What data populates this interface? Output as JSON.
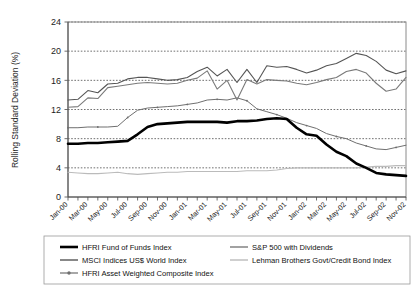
{
  "chart_data": {
    "type": "line",
    "title": "",
    "xlabel": "",
    "ylabel": "Rolling Standard Deviation (%)",
    "ylim": [
      0,
      24
    ],
    "yticks": [
      0,
      4,
      8,
      12,
      16,
      20,
      24
    ],
    "grid": true,
    "legend_position": "bottom",
    "x": [
      "Jan-00",
      "Feb-00",
      "Mar-00",
      "Apr-00",
      "May-00",
      "Jun-00",
      "Jul-00",
      "Aug-00",
      "Sep-00",
      "Oct-00",
      "Nov-00",
      "Dec-00",
      "Jan-01",
      "Feb-01",
      "Mar-01",
      "Apr-01",
      "May-01",
      "Jun-01",
      "Jul-01",
      "Aug-01",
      "Sep-01",
      "Oct-01",
      "Nov-01",
      "Dec-01",
      "Jan-02",
      "Feb-02",
      "Mar-02",
      "Apr-02",
      "May-02",
      "Jun-02",
      "Jul-02",
      "Aug-02",
      "Sep-02",
      "Oct-02",
      "Nov-02"
    ],
    "xtick_labels": [
      "Jan-00",
      "Mar-00",
      "May-00",
      "Jul-00",
      "Sep-00",
      "Nov-00",
      "Jan-01",
      "Mar-01",
      "May-01",
      "Jul-01",
      "Sep-01",
      "Nov-01",
      "Jan-02",
      "Mar-02",
      "May-02",
      "Jul-02",
      "Sep-02",
      "Nov-02"
    ],
    "series": [
      {
        "name": "HFRI Fund of Funds Index",
        "color": "#000000",
        "width": 2.6,
        "marker": "none",
        "values": [
          7.3,
          7.3,
          7.4,
          7.4,
          7.5,
          7.6,
          7.7,
          8.6,
          9.6,
          10.0,
          10.1,
          10.2,
          10.3,
          10.3,
          10.3,
          10.3,
          10.2,
          10.4,
          10.4,
          10.5,
          10.7,
          10.8,
          10.7,
          9.5,
          8.6,
          8.4,
          7.2,
          6.2,
          5.6,
          4.6,
          4.0,
          3.3,
          3.1,
          3.0,
          2.9
        ]
      },
      {
        "name": "MSCI Indices US$ World Index",
        "color": "#555555",
        "width": 1.1,
        "marker": "none",
        "values": [
          13.3,
          13.4,
          14.6,
          14.3,
          15.5,
          15.6,
          16.2,
          16.4,
          16.4,
          16.2,
          16.0,
          16.1,
          16.4,
          17.2,
          17.8,
          16.6,
          17.5,
          15.7,
          17.5,
          15.7,
          18.0,
          17.8,
          17.9,
          17.5,
          17.0,
          17.4,
          18.0,
          18.3,
          19.0,
          19.7,
          19.4,
          18.6,
          17.4,
          16.9,
          17.3
        ]
      },
      {
        "name": "HFRI Asset Weighted Composite Index",
        "color": "#6f6f6f",
        "width": 1.0,
        "marker": "dot",
        "values": [
          9.5,
          9.5,
          9.6,
          9.6,
          9.6,
          9.7,
          10.9,
          11.9,
          12.2,
          12.3,
          12.4,
          12.5,
          12.7,
          12.9,
          13.3,
          13.4,
          13.3,
          13.6,
          13.2,
          12.1,
          11.7,
          11.3,
          10.8,
          10.2,
          9.8,
          9.4,
          8.7,
          8.3,
          8.0,
          7.4,
          7.0,
          6.6,
          6.5,
          6.8,
          7.1
        ]
      },
      {
        "name": "S&P 500 with Dividends",
        "color": "#7a7a7a",
        "width": 1.1,
        "marker": "none",
        "values": [
          12.3,
          12.4,
          13.6,
          13.5,
          15.0,
          15.2,
          15.4,
          15.6,
          15.7,
          15.6,
          15.5,
          15.6,
          16.0,
          16.3,
          17.3,
          14.8,
          16.0,
          13.3,
          16.1,
          15.5,
          16.1,
          16.0,
          15.9,
          15.6,
          15.4,
          15.7,
          16.1,
          16.4,
          17.2,
          17.5,
          17.0,
          15.6,
          14.5,
          14.8,
          16.4
        ]
      },
      {
        "name": "Lehman Brothers Govt/Credit Bond Index",
        "color": "#bbbbbb",
        "width": 1.1,
        "marker": "none",
        "values": [
          3.4,
          3.3,
          3.2,
          3.2,
          3.3,
          3.4,
          3.2,
          3.1,
          3.2,
          3.3,
          3.4,
          3.4,
          3.5,
          3.5,
          3.5,
          3.5,
          3.5,
          3.5,
          3.6,
          3.6,
          3.6,
          3.7,
          3.9,
          4.0,
          4.0,
          4.0,
          4.0,
          4.0,
          4.0,
          4.0,
          4.1,
          4.2,
          4.2,
          4.3,
          4.3
        ]
      }
    ]
  },
  "legend": {
    "items": [
      {
        "label": "HFRI Fund of Funds Index",
        "color": "#000000",
        "width": 2.6,
        "marker": "none",
        "col": 0,
        "row": 0
      },
      {
        "label": "MSCI Indices US$ World Index",
        "color": "#555555",
        "width": 1.4,
        "marker": "none",
        "col": 0,
        "row": 1
      },
      {
        "label": "HFRI Asset Weighted Composite Index",
        "color": "#6f6f6f",
        "width": 1.2,
        "marker": "dot",
        "col": 0,
        "row": 2
      },
      {
        "label": "S&P 500 with Dividends",
        "color": "#7a7a7a",
        "width": 1.4,
        "marker": "none",
        "col": 1,
        "row": 0
      },
      {
        "label": "Lehman Brothers Govt/Credit Bond Index",
        "color": "#bbbbbb",
        "width": 1.4,
        "marker": "none",
        "col": 1,
        "row": 1
      }
    ]
  }
}
